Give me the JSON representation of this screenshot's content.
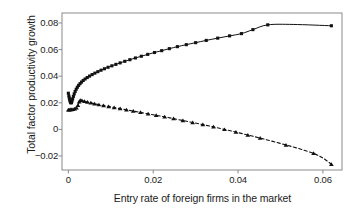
{
  "chart_data": {
    "type": "line",
    "title": "",
    "xlabel": "Entry rate of foreign firms in the market",
    "ylabel": "Total factor productivity growth",
    "xlim": [
      -0.0015,
      0.0645
    ],
    "ylim": [
      -0.0305,
      0.0875
    ],
    "xticks": [
      0,
      0.02,
      0.04,
      0.06
    ],
    "xtick_labels": [
      "0",
      "0.02",
      "0.04",
      "0.06"
    ],
    "yticks": [
      -0.02,
      0,
      0.02,
      0.04,
      0.06,
      0.08
    ],
    "ytick_labels": [
      "−0.02",
      "0",
      "0.02",
      "0.04",
      "0.06",
      "0.08"
    ],
    "grid": false,
    "legend": "none",
    "frame": true,
    "series": [
      {
        "name": "upper-curve",
        "linestyle": "solid",
        "marker": "square",
        "color": "#111111",
        "points": [
          [
            0.0,
            0.0272
          ],
          [
            0.00012,
            0.0252
          ],
          [
            0.00022,
            0.0236
          ],
          [
            0.00032,
            0.0222
          ],
          [
            0.00042,
            0.0211
          ],
          [
            0.00052,
            0.0203
          ],
          [
            0.00062,
            0.0199
          ],
          [
            0.00072,
            0.0202
          ],
          [
            0.00085,
            0.0213
          ],
          [
            0.001,
            0.0229
          ],
          [
            0.00118,
            0.0248
          ],
          [
            0.00138,
            0.0267
          ],
          [
            0.0016,
            0.0285
          ],
          [
            0.00185,
            0.0302
          ],
          [
            0.00212,
            0.0317
          ],
          [
            0.00242,
            0.0331
          ],
          [
            0.00275,
            0.0344
          ],
          [
            0.0031,
            0.0356
          ],
          [
            0.0035,
            0.0368
          ],
          [
            0.00395,
            0.0379
          ],
          [
            0.00445,
            0.039
          ],
          [
            0.005,
            0.0401
          ],
          [
            0.0056,
            0.0412
          ],
          [
            0.00625,
            0.0423
          ],
          [
            0.00695,
            0.0434
          ],
          [
            0.0077,
            0.0445
          ],
          [
            0.0085,
            0.0456
          ],
          [
            0.00935,
            0.0467
          ],
          [
            0.01025,
            0.0478
          ],
          [
            0.0112,
            0.0489
          ],
          [
            0.0122,
            0.05
          ],
          [
            0.0133,
            0.0512
          ],
          [
            0.0145,
            0.0524
          ],
          [
            0.0158,
            0.0537
          ],
          [
            0.0172,
            0.055
          ],
          [
            0.0187,
            0.0564
          ],
          [
            0.0203,
            0.0578
          ],
          [
            0.022,
            0.0592
          ],
          [
            0.0238,
            0.0607
          ],
          [
            0.0257,
            0.0622
          ],
          [
            0.0278,
            0.0637
          ],
          [
            0.03,
            0.0652
          ],
          [
            0.0325,
            0.0669
          ],
          [
            0.0352,
            0.0686
          ],
          [
            0.038,
            0.0703
          ],
          [
            0.0408,
            0.072
          ],
          [
            0.0435,
            0.075
          ],
          [
            0.047,
            0.0786
          ],
          [
            0.053,
            0.0789
          ],
          [
            0.062,
            0.0779
          ]
        ]
      },
      {
        "name": "lower-curve",
        "linestyle": "dashed",
        "marker": "triangle",
        "color": "#111111",
        "points": [
          [
            0.0,
            0.0148
          ],
          [
            0.0002,
            0.0148
          ],
          [
            0.00045,
            0.0149
          ],
          [
            0.00075,
            0.015
          ],
          [
            0.0011,
            0.0152
          ],
          [
            0.0015,
            0.0155
          ],
          [
            0.0019,
            0.0163
          ],
          [
            0.00225,
            0.0181
          ],
          [
            0.00255,
            0.0208
          ],
          [
            0.0028,
            0.0219
          ],
          [
            0.0032,
            0.0217
          ],
          [
            0.0038,
            0.0212
          ],
          [
            0.0045,
            0.0206
          ],
          [
            0.0053,
            0.02
          ],
          [
            0.0062,
            0.0193
          ],
          [
            0.0072,
            0.0186
          ],
          [
            0.0083,
            0.0179
          ],
          [
            0.0095,
            0.0172
          ],
          [
            0.0108,
            0.0164
          ],
          [
            0.0122,
            0.0156
          ],
          [
            0.0137,
            0.0147
          ],
          [
            0.0153,
            0.0138
          ],
          [
            0.017,
            0.0128
          ],
          [
            0.0188,
            0.0117
          ],
          [
            0.0207,
            0.0106
          ],
          [
            0.0227,
            0.0094
          ],
          [
            0.0248,
            0.0081
          ],
          [
            0.027,
            0.0067
          ],
          [
            0.0293,
            0.0052
          ],
          [
            0.0317,
            0.0036
          ],
          [
            0.0342,
            0.0019
          ],
          [
            0.0368,
            0.0
          ],
          [
            0.0395,
            -0.002
          ],
          [
            0.0423,
            -0.0042
          ],
          [
            0.0452,
            -0.0065
          ],
          [
            0.0482,
            -0.009
          ],
          [
            0.0513,
            -0.0117
          ],
          [
            0.0545,
            -0.0146
          ],
          [
            0.0578,
            -0.018
          ],
          [
            0.06,
            -0.0215
          ],
          [
            0.062,
            -0.0262
          ]
        ]
      }
    ],
    "markers_upper": [
      [
        0.0,
        0.0272
      ],
      [
        0.00012,
        0.0252
      ],
      [
        0.00022,
        0.0236
      ],
      [
        0.00032,
        0.0222
      ],
      [
        0.00042,
        0.0211
      ],
      [
        0.00052,
        0.0203
      ],
      [
        0.00062,
        0.0199
      ],
      [
        0.00072,
        0.0202
      ],
      [
        0.00085,
        0.0213
      ],
      [
        0.001,
        0.0229
      ],
      [
        0.00118,
        0.0248
      ],
      [
        0.00138,
        0.0267
      ],
      [
        0.0016,
        0.0285
      ],
      [
        0.00185,
        0.0302
      ],
      [
        0.00212,
        0.0317
      ],
      [
        0.00242,
        0.0331
      ],
      [
        0.00275,
        0.0344
      ],
      [
        0.0031,
        0.0356
      ],
      [
        0.0035,
        0.0368
      ],
      [
        0.00395,
        0.0379
      ],
      [
        0.00445,
        0.039
      ],
      [
        0.005,
        0.0401
      ],
      [
        0.0056,
        0.0412
      ],
      [
        0.00625,
        0.0423
      ],
      [
        0.00695,
        0.0434
      ],
      [
        0.0077,
        0.0445
      ],
      [
        0.0085,
        0.0456
      ],
      [
        0.00935,
        0.0467
      ],
      [
        0.01025,
        0.0478
      ],
      [
        0.0112,
        0.0489
      ],
      [
        0.0122,
        0.05
      ],
      [
        0.0133,
        0.0512
      ],
      [
        0.0145,
        0.0524
      ],
      [
        0.0158,
        0.0537
      ],
      [
        0.0172,
        0.055
      ],
      [
        0.0187,
        0.0564
      ],
      [
        0.0203,
        0.0578
      ],
      [
        0.022,
        0.0592
      ],
      [
        0.0238,
        0.0607
      ],
      [
        0.0257,
        0.0622
      ],
      [
        0.0278,
        0.0637
      ],
      [
        0.03,
        0.0652
      ],
      [
        0.0325,
        0.0669
      ],
      [
        0.0352,
        0.0686
      ],
      [
        0.038,
        0.0703
      ],
      [
        0.0408,
        0.072
      ],
      [
        0.0435,
        0.075
      ],
      [
        0.047,
        0.0786
      ],
      [
        0.062,
        0.0779
      ]
    ],
    "markers_lower": [
      [
        0.0,
        0.0148
      ],
      [
        0.0002,
        0.0148
      ],
      [
        0.00045,
        0.0149
      ],
      [
        0.00075,
        0.015
      ],
      [
        0.0011,
        0.0152
      ],
      [
        0.0015,
        0.0155
      ],
      [
        0.0019,
        0.0163
      ],
      [
        0.00225,
        0.0181
      ],
      [
        0.00255,
        0.0208
      ],
      [
        0.0028,
        0.0219
      ],
      [
        0.0032,
        0.0217
      ],
      [
        0.0038,
        0.0212
      ],
      [
        0.0045,
        0.0206
      ],
      [
        0.0053,
        0.02
      ],
      [
        0.0062,
        0.0193
      ],
      [
        0.0072,
        0.0186
      ],
      [
        0.0083,
        0.0179
      ],
      [
        0.0095,
        0.0172
      ],
      [
        0.0108,
        0.0164
      ],
      [
        0.0122,
        0.0156
      ],
      [
        0.0137,
        0.0147
      ],
      [
        0.0153,
        0.0138
      ],
      [
        0.017,
        0.0128
      ],
      [
        0.0188,
        0.0117
      ],
      [
        0.0207,
        0.0106
      ],
      [
        0.0227,
        0.0094
      ],
      [
        0.0248,
        0.0081
      ],
      [
        0.027,
        0.0067
      ],
      [
        0.0293,
        0.0052
      ],
      [
        0.0317,
        0.0036
      ],
      [
        0.0342,
        0.0019
      ],
      [
        0.0368,
        0.0
      ],
      [
        0.0395,
        -0.002
      ],
      [
        0.0423,
        -0.0042
      ],
      [
        0.0452,
        -0.0065
      ],
      [
        0.0513,
        -0.0117
      ],
      [
        0.0578,
        -0.018
      ],
      [
        0.062,
        -0.0262
      ]
    ],
    "axis_color": "#8a8a8a",
    "line_color": "#111111"
  }
}
